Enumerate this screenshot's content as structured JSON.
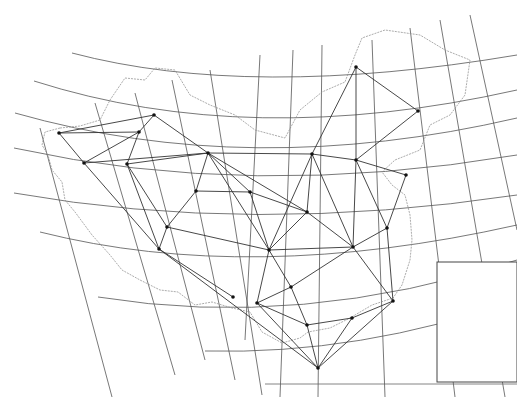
{
  "map": {
    "title": "",
    "colors": {
      "background": "#ffffff",
      "graticule": "#555555",
      "border": "#777777",
      "network": "#333333",
      "node": "#111111"
    },
    "graticule": {
      "meridians": [
        "M40,128 L112,397",
        "M95,103 L175,375",
        "M135,93 L205,360",
        "M172,80 L235,380",
        "M210,70 L262,395",
        "M260,55 L245,340",
        "M293,50 L280,397",
        "M322,45 L318,397",
        "M372,40 L385,397",
        "M410,28 L455,397",
        "M440,20 L505,397",
        "M470,15 L517,230"
      ],
      "parallels": [
        "M72,53 Q250,100 517,55",
        "M34,81 Q250,150 517,90",
        "M15,113 Q250,180 517,118",
        "M14,148 Q250,200 517,155",
        "M14,193 Q250,235 517,195",
        "M40,232 Q250,285 517,225",
        "M98,297 Q300,330 517,260",
        "M205,351 Q360,355 517,300"
      ]
    },
    "nodes": [
      {
        "id": "n1",
        "x": 59,
        "y": 133
      },
      {
        "id": "n2",
        "x": 154,
        "y": 115
      },
      {
        "id": "n3",
        "x": 139,
        "y": 132
      },
      {
        "id": "n4",
        "x": 84,
        "y": 163
      },
      {
        "id": "n5",
        "x": 127,
        "y": 164
      },
      {
        "id": "n6",
        "x": 208,
        "y": 153
      },
      {
        "id": "n7",
        "x": 196,
        "y": 191
      },
      {
        "id": "n8",
        "x": 250,
        "y": 192
      },
      {
        "id": "n9",
        "x": 356,
        "y": 67
      },
      {
        "id": "n10",
        "x": 418,
        "y": 111
      },
      {
        "id": "n11",
        "x": 356,
        "y": 160
      },
      {
        "id": "n12",
        "x": 312,
        "y": 154
      },
      {
        "id": "n13",
        "x": 406,
        "y": 175
      },
      {
        "id": "n14",
        "x": 307,
        "y": 212
      },
      {
        "id": "n15",
        "x": 167,
        "y": 227
      },
      {
        "id": "n16",
        "x": 159,
        "y": 249
      },
      {
        "id": "n17",
        "x": 269,
        "y": 250
      },
      {
        "id": "n18",
        "x": 353,
        "y": 247
      },
      {
        "id": "n19",
        "x": 387,
        "y": 228
      },
      {
        "id": "n20",
        "x": 291,
        "y": 287
      },
      {
        "id": "n21",
        "x": 233,
        "y": 297
      },
      {
        "id": "n22",
        "x": 257,
        "y": 303
      },
      {
        "id": "n23",
        "x": 393,
        "y": 301
      },
      {
        "id": "n24",
        "x": 307,
        "y": 325
      },
      {
        "id": "n25",
        "x": 352,
        "y": 318
      },
      {
        "id": "n26",
        "x": 318,
        "y": 368
      }
    ],
    "edges": [
      [
        "n1",
        "n2"
      ],
      [
        "n1",
        "n3"
      ],
      [
        "n1",
        "n4"
      ],
      [
        "n2",
        "n3"
      ],
      [
        "n2",
        "n6"
      ],
      [
        "n3",
        "n4"
      ],
      [
        "n3",
        "n5"
      ],
      [
        "n4",
        "n6"
      ],
      [
        "n5",
        "n6"
      ],
      [
        "n5",
        "n15"
      ],
      [
        "n5",
        "n16"
      ],
      [
        "n4",
        "n16"
      ],
      [
        "n6",
        "n7"
      ],
      [
        "n6",
        "n8"
      ],
      [
        "n6",
        "n12"
      ],
      [
        "n6",
        "n14"
      ],
      [
        "n6",
        "n17"
      ],
      [
        "n7",
        "n8"
      ],
      [
        "n7",
        "n15"
      ],
      [
        "n8",
        "n14"
      ],
      [
        "n8",
        "n17"
      ],
      [
        "n12",
        "n14"
      ],
      [
        "n12",
        "n11"
      ],
      [
        "n12",
        "n9"
      ],
      [
        "n12",
        "n17"
      ],
      [
        "n12",
        "n18"
      ],
      [
        "n9",
        "n10"
      ],
      [
        "n9",
        "n11"
      ],
      [
        "n10",
        "n11"
      ],
      [
        "n11",
        "n13"
      ],
      [
        "n11",
        "n18"
      ],
      [
        "n11",
        "n19"
      ],
      [
        "n13",
        "n19"
      ],
      [
        "n14",
        "n17"
      ],
      [
        "n14",
        "n18"
      ],
      [
        "n15",
        "n16"
      ],
      [
        "n15",
        "n17"
      ],
      [
        "n17",
        "n20"
      ],
      [
        "n17",
        "n22"
      ],
      [
        "n17",
        "n18"
      ],
      [
        "n18",
        "n19"
      ],
      [
        "n18",
        "n20"
      ],
      [
        "n18",
        "n23"
      ],
      [
        "n19",
        "n23"
      ],
      [
        "n20",
        "n24"
      ],
      [
        "n20",
        "n22"
      ],
      [
        "n22",
        "n24"
      ],
      [
        "n22",
        "n26"
      ],
      [
        "n21",
        "n16"
      ],
      [
        "n16",
        "n26"
      ],
      [
        "n24",
        "n25"
      ],
      [
        "n25",
        "n23"
      ],
      [
        "n25",
        "n26"
      ],
      [
        "n23",
        "n26"
      ],
      [
        "n24",
        "n26"
      ]
    ],
    "border_path": "M60,128 L45,132 L42,145 L48,155 L52,170 L62,182 L65,200 L75,212 L92,235 L110,255 L122,270 L140,280 L160,290 L178,292 L195,305 L212,302 L232,308 L250,312 L262,332 L282,343 L300,338 L308,332 L330,328 L350,318 L372,305 L393,298 L402,285 L410,260 L412,240 L410,215 L405,195 L392,185 L382,172 L395,160 L420,150 L430,125 L450,115 L465,95 L470,60 L445,50 L420,35 L385,30 L362,38 L355,55 L345,82 L322,92 L300,110 L285,138 L255,130 L235,115 L210,105 L190,95 L175,70 L155,68 L145,80 L125,78 L110,100 L100,120 L80,126 Z",
    "inset": {
      "x": 437,
      "y": 262,
      "width": 80,
      "height": 120
    },
    "frame_bottom_y": 384
  }
}
